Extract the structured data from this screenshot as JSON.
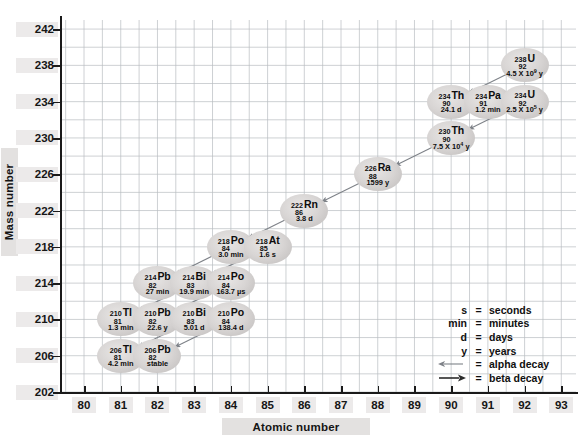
{
  "chart_data": {
    "type": "scatter",
    "xlabel": "Atomic number",
    "ylabel": "Mass number",
    "xlim": [
      79.4,
      93.4
    ],
    "ylim": [
      202,
      243
    ],
    "xticks": [
      80,
      81,
      82,
      83,
      84,
      85,
      86,
      87,
      88,
      89,
      90,
      91,
      92,
      93
    ],
    "yticks": [
      202,
      206,
      210,
      214,
      218,
      222,
      226,
      230,
      234,
      238,
      242
    ],
    "grid": true,
    "grid_x_step": 0.5,
    "grid_y_step": 2,
    "legend_position": "inside-bottom-right",
    "nuclides": [
      {
        "element": "U",
        "Z": 92,
        "A": 238,
        "half_life": "4.5 X 10",
        "half_life_exp": "9",
        "half_life_unit": "y"
      },
      {
        "element": "Th",
        "Z": 90,
        "A": 234,
        "half_life": "24.1",
        "half_life_exp": "",
        "half_life_unit": "d"
      },
      {
        "element": "Pa",
        "Z": 91,
        "A": 234,
        "half_life": "1.2",
        "half_life_exp": "",
        "half_life_unit": "min"
      },
      {
        "element": "U",
        "Z": 92,
        "A": 234,
        "half_life": "2.5 X 10",
        "half_life_exp": "5",
        "half_life_unit": "y"
      },
      {
        "element": "Th",
        "Z": 90,
        "A": 230,
        "half_life": "7.5 X 10",
        "half_life_exp": "4",
        "half_life_unit": "y"
      },
      {
        "element": "Ra",
        "Z": 88,
        "A": 226,
        "half_life": "1599",
        "half_life_exp": "",
        "half_life_unit": "y"
      },
      {
        "element": "Rn",
        "Z": 86,
        "A": 222,
        "half_life": "3.8",
        "half_life_exp": "",
        "half_life_unit": "d"
      },
      {
        "element": "Po",
        "Z": 84,
        "A": 218,
        "half_life": "3.0",
        "half_life_exp": "",
        "half_life_unit": "min"
      },
      {
        "element": "At",
        "Z": 85,
        "A": 218,
        "half_life": "1.6",
        "half_life_exp": "",
        "half_life_unit": "s"
      },
      {
        "element": "Pb",
        "Z": 82,
        "A": 214,
        "half_life": "27",
        "half_life_exp": "",
        "half_life_unit": "min"
      },
      {
        "element": "Bi",
        "Z": 83,
        "A": 214,
        "half_life": "19.9",
        "half_life_exp": "",
        "half_life_unit": "min"
      },
      {
        "element": "Po",
        "Z": 84,
        "A": 214,
        "half_life": "163.7",
        "half_life_exp": "",
        "half_life_unit": "µs"
      },
      {
        "element": "Tl",
        "Z": 81,
        "A": 210,
        "half_life": "1.3",
        "half_life_exp": "",
        "half_life_unit": "min"
      },
      {
        "element": "Pb",
        "Z": 82,
        "A": 210,
        "half_life": "22.6",
        "half_life_exp": "",
        "half_life_unit": "y"
      },
      {
        "element": "Bi",
        "Z": 83,
        "A": 210,
        "half_life": "5.01",
        "half_life_exp": "",
        "half_life_unit": "d"
      },
      {
        "element": "Po",
        "Z": 84,
        "A": 210,
        "half_life": "138.4",
        "half_life_exp": "",
        "half_life_unit": "d"
      },
      {
        "element": "Tl",
        "Z": 81,
        "A": 206,
        "half_life": "4.2",
        "half_life_exp": "",
        "half_life_unit": "min"
      },
      {
        "element": "Pb",
        "Z": 82,
        "A": 206,
        "half_life": "stable",
        "half_life_exp": "",
        "half_life_unit": ""
      }
    ],
    "decays": [
      {
        "from": [
          92,
          238
        ],
        "to": [
          90,
          234
        ],
        "mode": "alpha"
      },
      {
        "from": [
          90,
          234
        ],
        "to": [
          91,
          234
        ],
        "mode": "beta"
      },
      {
        "from": [
          91,
          234
        ],
        "to": [
          92,
          234
        ],
        "mode": "beta"
      },
      {
        "from": [
          92,
          234
        ],
        "to": [
          90,
          230
        ],
        "mode": "alpha"
      },
      {
        "from": [
          90,
          230
        ],
        "to": [
          88,
          226
        ],
        "mode": "alpha"
      },
      {
        "from": [
          88,
          226
        ],
        "to": [
          86,
          222
        ],
        "mode": "alpha"
      },
      {
        "from": [
          86,
          222
        ],
        "to": [
          84,
          218
        ],
        "mode": "alpha"
      },
      {
        "from": [
          84,
          218
        ],
        "to": [
          85,
          218
        ],
        "mode": "beta"
      },
      {
        "from": [
          84,
          218
        ],
        "to": [
          82,
          214
        ],
        "mode": "alpha"
      },
      {
        "from": [
          85,
          218
        ],
        "to": [
          83,
          214
        ],
        "mode": "alpha"
      },
      {
        "from": [
          82,
          214
        ],
        "to": [
          83,
          214
        ],
        "mode": "beta"
      },
      {
        "from": [
          83,
          214
        ],
        "to": [
          84,
          214
        ],
        "mode": "beta"
      },
      {
        "from": [
          83,
          214
        ],
        "to": [
          81,
          210
        ],
        "mode": "alpha"
      },
      {
        "from": [
          84,
          214
        ],
        "to": [
          82,
          210
        ],
        "mode": "alpha"
      },
      {
        "from": [
          81,
          210
        ],
        "to": [
          82,
          210
        ],
        "mode": "beta"
      },
      {
        "from": [
          82,
          210
        ],
        "to": [
          83,
          210
        ],
        "mode": "beta"
      },
      {
        "from": [
          83,
          210
        ],
        "to": [
          84,
          210
        ],
        "mode": "beta"
      },
      {
        "from": [
          83,
          210
        ],
        "to": [
          81,
          206
        ],
        "mode": "alpha"
      },
      {
        "from": [
          84,
          210
        ],
        "to": [
          82,
          206
        ],
        "mode": "alpha"
      },
      {
        "from": [
          81,
          206
        ],
        "to": [
          82,
          206
        ],
        "mode": "beta"
      }
    ],
    "colors": {
      "bubble": "#d6d3d2",
      "grid": "#b9bdc2",
      "axis": "#1a1a1a",
      "text": "#0d0d0d",
      "arrow": "#7e8288"
    }
  },
  "axes": {
    "x_title": "Atomic number",
    "y_title": "Mass number"
  },
  "legend": {
    "rows": [
      {
        "key": "s",
        "eq": "=",
        "value": "seconds",
        "icon": ""
      },
      {
        "key": "min",
        "eq": "=",
        "value": "minutes",
        "icon": ""
      },
      {
        "key": "d",
        "eq": "=",
        "value": "days",
        "icon": ""
      },
      {
        "key": "y",
        "eq": "=",
        "value": "years",
        "icon": ""
      },
      {
        "key": "",
        "eq": "=",
        "value": "alpha decay",
        "icon": "alpha-arrow-icon"
      },
      {
        "key": "",
        "eq": "=",
        "value": "beta decay",
        "icon": "beta-arrow-icon"
      }
    ]
  }
}
